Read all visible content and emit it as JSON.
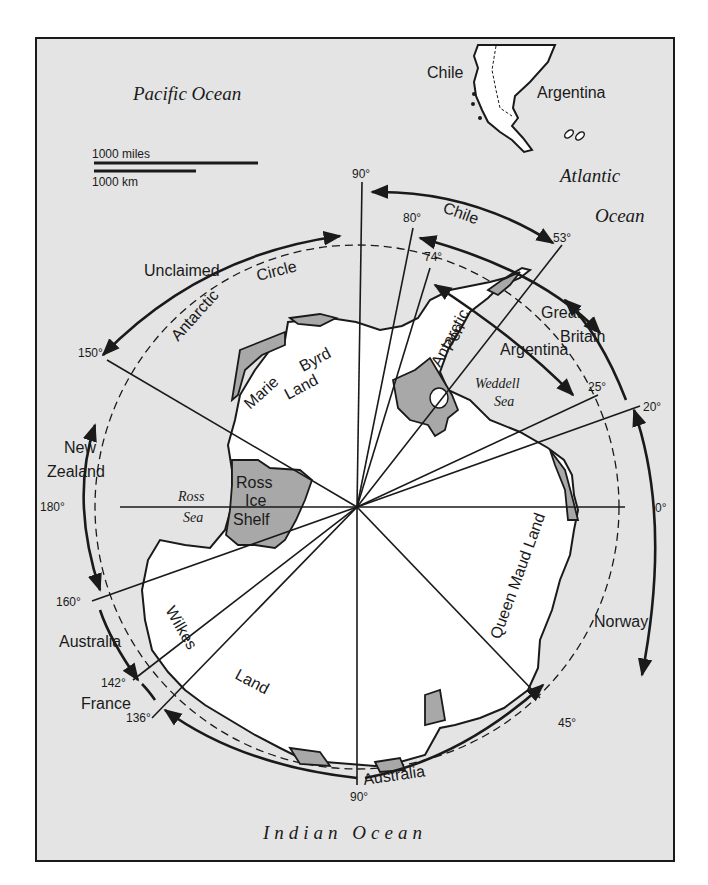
{
  "oceans": {
    "pacific": "Pacific Ocean",
    "atlantic_1": "Atlantic",
    "atlantic_2": "Ocean",
    "indian": "Indian Ocean"
  },
  "scale": {
    "miles": "1000 miles",
    "km": "1000 km"
  },
  "countries_south_america": {
    "chile": "Chile",
    "argentina": "Argentina"
  },
  "claims": {
    "chile": "Chile",
    "great_britain_1": "Great",
    "great_britain_2": "Britain",
    "argentina": "Argentina",
    "unclaimed": "Unclaimed",
    "new_zealand_1": "New",
    "new_zealand_2": "Zealand",
    "australia_west": "Australia",
    "france": "France",
    "australia_east": "Australia",
    "norway": "Norway"
  },
  "regions": {
    "antarctic_circle_1": "Antarctic",
    "antarctic_circle_2": "Circle",
    "marie_byrd_1": "Marie",
    "marie_byrd_2": "Byrd",
    "marie_byrd_3": "Land",
    "antarctic_pen_1": "Antarctic",
    "antarctic_pen_2": "Pen",
    "weddell_1": "Weddell",
    "weddell_2": "Sea",
    "ross_sea_1": "Ross",
    "ross_sea_2": "Sea",
    "ross_ice_1": "Ross",
    "ross_ice_2": "Ice",
    "ross_ice_3": "Shelf",
    "queen_maud": "Queen Maud Land",
    "wilkes": "Wilkes",
    "wilkes_land": "Land"
  },
  "meridians": {
    "m90n": "90°",
    "m80": "80°",
    "m74": "74°",
    "m53": "53°",
    "m25": "25°",
    "m20": "20°",
    "m0": "0°",
    "m45": "45°",
    "m90s": "90°",
    "m136": "136°",
    "m142": "142°",
    "m160": "160°",
    "m180": "180°",
    "m150": "150°"
  },
  "colors": {
    "ocean": "#e4e4e4",
    "land": "#ffffff",
    "ice_shelf": "#a8a8a8",
    "ink": "#1a1a1a"
  }
}
